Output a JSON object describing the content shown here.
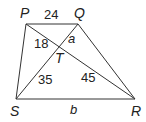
{
  "figure": {
    "type": "trapezoid with diagonals",
    "vertices": {
      "P": "P",
      "Q": "Q",
      "R": "R",
      "S": "S",
      "T": "T"
    },
    "segment_labels": {
      "PQ": "24",
      "PT": "18",
      "QT": "a",
      "ST": "35",
      "RT": "45",
      "SR": "b"
    },
    "colors": {
      "line": "#333333",
      "text": "#222222",
      "background": "#ffffff"
    }
  }
}
